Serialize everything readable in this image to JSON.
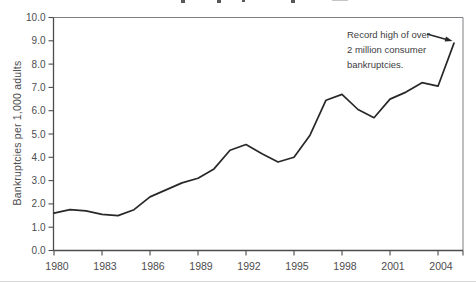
{
  "figure": {
    "y_axis_title": "Bankruptcies per 1,000 adults",
    "annotation": {
      "line1": "Record high of over",
      "line2": "2 million consumer",
      "line3": "bankruptcies."
    }
  },
  "colors": {
    "line": "#282828",
    "axis": "#4d4d4f",
    "frame": "#7d7f82",
    "tick_label": "#4d4d4f",
    "annotation_text": "#414042",
    "bottom_rule": "#d6d6d6"
  },
  "chart_data": {
    "type": "line",
    "title": "",
    "title_cropped_out_of_view": true,
    "xlabel": "",
    "ylabel": "Bankruptcies per 1,000 adults",
    "x": [
      1980,
      1981,
      1982,
      1983,
      1984,
      1985,
      1986,
      1987,
      1988,
      1989,
      1990,
      1991,
      1992,
      1993,
      1994,
      1995,
      1996,
      1997,
      1998,
      1999,
      2000,
      2001,
      2002,
      2003,
      2004,
      2005
    ],
    "values": [
      1.6,
      1.75,
      1.7,
      1.55,
      1.5,
      1.75,
      2.3,
      2.6,
      2.9,
      3.1,
      3.5,
      4.3,
      4.55,
      4.15,
      3.8,
      4.0,
      4.95,
      6.45,
      6.7,
      6.05,
      5.7,
      6.5,
      6.8,
      7.2,
      7.05,
      8.9
    ],
    "xlim": [
      1980,
      2005.6
    ],
    "ylim": [
      0,
      10
    ],
    "grid": false,
    "legend": "none",
    "xtick_years": [
      1980,
      1983,
      1986,
      1989,
      1992,
      1995,
      1998,
      2001,
      2004
    ],
    "xtick_labels": [
      "1980",
      "1983",
      "1986",
      "1989",
      "1992",
      "1995",
      "1998",
      "2001",
      "2004"
    ],
    "ytick_values": [
      0,
      1,
      2,
      3,
      4,
      5,
      6,
      7,
      8,
      9,
      10
    ],
    "ytick_labels": [
      "0.0",
      "1.0",
      "2.0",
      "3.0",
      "4.0",
      "5.0",
      "6.0",
      "7.0",
      "8.0",
      "9.0",
      "10.0"
    ],
    "annotation": "Record high of over 2 million consumer bankruptcies.",
    "annotation_points_to": {
      "year": 2005,
      "value": 8.9
    }
  }
}
